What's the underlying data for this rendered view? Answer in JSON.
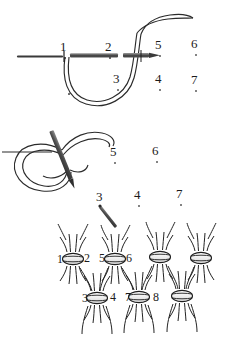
{
  "figure": {
    "background_color": "#ffffff",
    "ink_color": "#1b1b1b",
    "needle_color": "#4a4a4a",
    "needle_highlight": "#8d8d8d"
  },
  "panels": [
    {
      "id": "panel-top",
      "name": "needle-through-tissue-with-thread-loop",
      "labels": [
        {
          "text": "1",
          "x": 60,
          "y": 40,
          "dot": {
            "x": 64,
            "y": 57,
            "solid": true
          }
        },
        {
          "text": "2",
          "x": 105,
          "y": 40,
          "dot": {
            "x": 109,
            "y": 57,
            "solid": true
          }
        },
        {
          "text": "5",
          "x": 155,
          "y": 38,
          "dot": {
            "x": 159,
            "y": 55,
            "solid": false
          }
        },
        {
          "text": "6",
          "x": 191,
          "y": 37,
          "dot": {
            "x": 195,
            "y": 54,
            "solid": false
          }
        },
        {
          "text": "3",
          "x": 113,
          "y": 72,
          "dot": {
            "x": 117,
            "y": 89,
            "solid": false
          }
        },
        {
          "text": "4",
          "x": 155,
          "y": 72,
          "dot": {
            "x": 159,
            "y": 89,
            "solid": false
          }
        },
        {
          "text": "7",
          "x": 191,
          "y": 73,
          "dot": {
            "x": 195,
            "y": 90,
            "solid": false
          }
        },
        {
          "text": "",
          "x": 66,
          "y": 80,
          "dot": {
            "x": 68,
            "y": 93,
            "solid": true
          }
        }
      ]
    },
    {
      "id": "panel-middle",
      "name": "thread-loop-with-needle-passing-through",
      "labels": [
        {
          "text": "5",
          "x": 110,
          "y": 145,
          "dot": {
            "x": 114,
            "y": 162,
            "solid": false
          }
        },
        {
          "text": "6",
          "x": 152,
          "y": 144,
          "dot": {
            "x": 156,
            "y": 161,
            "solid": false
          }
        },
        {
          "text": "3",
          "x": 96,
          "y": 190,
          "dot": {
            "x": 100,
            "y": 205,
            "solid": true
          }
        },
        {
          "text": "4",
          "x": 134,
          "y": 188,
          "dot": {
            "x": 138,
            "y": 205,
            "solid": false
          }
        },
        {
          "text": "7",
          "x": 176,
          "y": 187,
          "dot": {
            "x": 180,
            "y": 204,
            "solid": false
          }
        }
      ]
    },
    {
      "id": "panel-bottom",
      "name": "tied-knot-array",
      "labels": [
        {
          "text": "1",
          "x": 57,
          "y": 253,
          "dot": null
        },
        {
          "text": "2",
          "x": 84,
          "y": 252,
          "dot": null
        },
        {
          "text": "5",
          "x": 99,
          "y": 252,
          "dot": null
        },
        {
          "text": "6",
          "x": 126,
          "y": 252,
          "dot": null
        },
        {
          "text": "3",
          "x": 82,
          "y": 292,
          "dot": null
        },
        {
          "text": "4",
          "x": 110,
          "y": 291,
          "dot": null
        },
        {
          "text": "7",
          "x": 125,
          "y": 291,
          "dot": null
        },
        {
          "text": "8",
          "x": 153,
          "y": 291,
          "dot": null
        }
      ],
      "knots_top_row_x": [
        73,
        115,
        160,
        201
      ],
      "knots_top_row_y": 259,
      "knots_bottom_row_x": [
        97,
        139,
        182
      ],
      "knots_bottom_row_y": 298
    }
  ]
}
